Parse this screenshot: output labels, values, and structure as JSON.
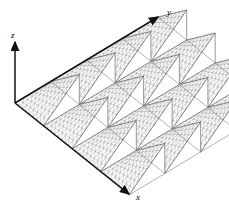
{
  "figure": {
    "type": "3d-wireframe-surface",
    "background_color": "#ffffff",
    "mesh_color": "#8a8a8a",
    "mesh_edge_color": "#555555",
    "axis_color": "#111111",
    "width": 229,
    "height": 213
  },
  "axes": {
    "x": {
      "label": "x",
      "label_x": 136,
      "label_y": 200,
      "arrow_tip_x": 129,
      "arrow_tip_y": 194
    },
    "y": {
      "label": "y",
      "label_x": 167,
      "label_y": 15,
      "arrow_tip_x": 158,
      "arrow_tip_y": 17
    },
    "z": {
      "label": "z",
      "label_x": 11,
      "label_y": 38,
      "arrow_tip_x": 15,
      "arrow_tip_y": 42
    },
    "origin": {
      "x": 15,
      "y": 103
    }
  },
  "chart_data": {
    "type": "surface",
    "title": "",
    "xlabel": "x",
    "ylabel": "y",
    "zlabel": "z",
    "projection": "axonometric",
    "grid": true,
    "legend": false,
    "surface_function": "z = sawtooth(x) * sawtooth(y)",
    "period_x": 1,
    "period_y": 1,
    "n_periods_x": 4,
    "n_periods_y": 4,
    "mesh_divisions_per_period": 8,
    "xlim": [
      0,
      4
    ],
    "ylim": [
      0,
      4
    ],
    "zlim": [
      0,
      1
    ],
    "tooth_profile": {
      "shape": "ramp",
      "rise": "linear from 0 to 1 across each period",
      "fall": "vertical drop from 1 to 0 at period boundary"
    },
    "projection_basis": {
      "x_axis_screen_delta": [
        28.5,
        23.0
      ],
      "y_axis_screen_delta": [
        35.8,
        -21.5
      ],
      "z_axis_screen_delta": [
        0,
        -30.0
      ]
    }
  }
}
